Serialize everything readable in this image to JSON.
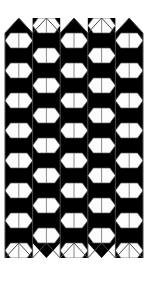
{
  "artwork": {
    "title": "Hexagonal Tessellation Pattern",
    "type": "geometric-op-art-pattern",
    "caption": "",
    "canvas": {
      "width": 152,
      "height": 285,
      "background_color": "#ffffff"
    },
    "colors": {
      "background": "#ffffff",
      "ink": "#000000",
      "cell_fill": "#fdfdfd",
      "outline": "#5a5a5a",
      "shadow_line": "#8a8a8a"
    },
    "geometry": {
      "pattern_left": 5,
      "pattern_right": 143,
      "pattern_top": 33,
      "pattern_bottom": 258,
      "column_count": 5,
      "column_width": 27.6,
      "row_period": 30,
      "hexagon_half_height": 15,
      "hexagon_side_inset": 0,
      "top_edge": "zigzag-peaks",
      "bottom_edge": "zigzag-valleys",
      "column_vertical_offsets": [
        0,
        15,
        0,
        15,
        0
      ]
    },
    "elements": {
      "hexagon_label": "white-hexagon-cell",
      "triangle_label": "black-triangle-fill",
      "center_line_label": "hexagon-center-line",
      "edge_label": "pattern-edge-outline"
    }
  }
}
